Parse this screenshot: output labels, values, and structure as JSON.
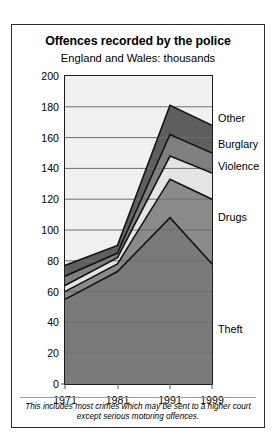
{
  "chart_data": {
    "type": "area",
    "stacked": true,
    "title": "Offences recorded by the police",
    "subtitle": "England and Wales: thousands",
    "xlabel": "",
    "ylabel": "",
    "x": [
      1971,
      1981,
      1991,
      1999
    ],
    "xticklabels": [
      "1971",
      "1981",
      "1991",
      "1999"
    ],
    "xlim": [
      1971,
      1999
    ],
    "ylim": [
      0,
      200
    ],
    "yticks": [
      0,
      20,
      40,
      60,
      80,
      100,
      120,
      140,
      160,
      180,
      200
    ],
    "yticklabels": [
      "0",
      "20",
      "40",
      "60",
      "80",
      "100",
      "120",
      "140",
      "160",
      "180",
      "200"
    ],
    "grid": true,
    "grid_axis": "y",
    "legend_position": "right-inline",
    "series": [
      {
        "name": "Theft",
        "values": [
          55,
          73,
          108,
          78
        ],
        "color": "#7a7a7a",
        "label_value": 35
      },
      {
        "name": "Drugs",
        "values": [
          60,
          78,
          133,
          120
        ],
        "color": "#8a8a8a",
        "label_value": 108
      },
      {
        "name": "Violence",
        "values": [
          64,
          82,
          148,
          137
        ],
        "color": "#e4e4e4",
        "label_value": 141
      },
      {
        "name": "Burglary",
        "values": [
          70,
          85,
          162,
          150
        ],
        "color": "#7f7f7f",
        "label_value": 155
      },
      {
        "name": "Other",
        "values": [
          77,
          90,
          181,
          168
        ],
        "color": "#5e5e5e",
        "label_value": 172
      }
    ],
    "annotation": "This includes most crimes which may be sent to a higher court except serious motoring offences."
  },
  "colors": {
    "plot_background": "#f0f0f0",
    "frame": "#1c1c1c",
    "gridline": "#6e6e6e",
    "text": "#000000"
  }
}
